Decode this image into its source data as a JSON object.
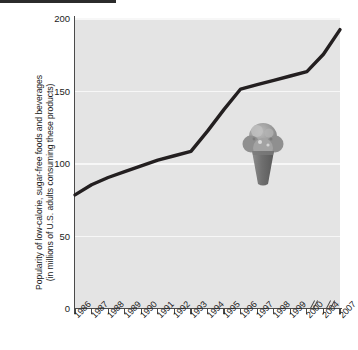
{
  "chart_data": {
    "type": "line",
    "title": "",
    "xlabel": "",
    "ylabel": "Popularity of low-calorie, sugar-free foods and beverages (in millions of U.S. adults consuming these products)",
    "ylabel_line1": "Popularity of low-calorie, sugar-free foods and beverages",
    "ylabel_line2": "(in millions of U.S. adults consuming these products)",
    "ylim": [
      0,
      200
    ],
    "yticks": [
      0,
      50,
      100,
      150,
      200
    ],
    "ytick_labels": [
      "0",
      "50",
      "100",
      "150",
      "200"
    ],
    "grid": true,
    "grid_color": "#f7f7f7",
    "plot_background": "#e4e4e4",
    "line_color": "#231f20",
    "legend": "none",
    "categories": [
      "1986",
      "1987",
      "1988",
      "1989",
      "1990",
      "1991",
      "1992",
      "1993",
      "1994",
      "1995",
      "1996",
      "1997",
      "1998",
      "1999",
      "2000",
      "2004",
      "2007"
    ],
    "values": [
      78,
      85,
      90,
      94,
      98,
      102,
      105,
      108,
      122,
      137,
      151,
      154,
      157,
      160,
      163,
      175,
      192
    ],
    "axis_breaks_after": [
      "2000",
      "2004"
    ],
    "annotation_image": "ice-cream-cone"
  },
  "axis": {
    "y_tick_values": [
      "200",
      "150",
      "100",
      "50",
      "0"
    ]
  },
  "decor": {
    "top_rule": "",
    "cone_name": "ice-cream-cone-illustration"
  }
}
